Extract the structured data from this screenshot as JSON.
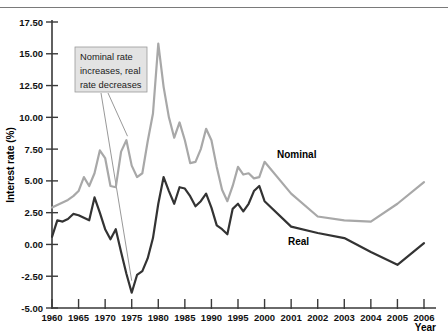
{
  "figure": {
    "top_rule": true,
    "background": "#ffffff"
  },
  "axes": {
    "y_title": "Interest rate (%)",
    "x_title": "Year",
    "y_ticks": [
      "-5.00",
      "-2.50",
      "0.00",
      "2.50",
      "5.00",
      "7.50",
      "10.00",
      "12.50",
      "15.00",
      "17.50"
    ],
    "x_ticks": [
      "1960",
      "1965",
      "1970",
      "1975",
      "1980",
      "1985",
      "1990",
      "1995",
      "2000",
      "2001",
      "2002",
      "2003",
      "2004",
      "2005",
      "2006"
    ]
  },
  "annotation": {
    "line1": "Nominal rate",
    "line2": "increases, real",
    "line3": "rate decreases"
  },
  "labels": {
    "nominal": "Nominal",
    "real": "Real"
  },
  "colors": {
    "nominal": "#a8a8a8",
    "real": "#333333",
    "axis": "#3a3a3a",
    "annotation_box": "#e3e3e3",
    "top_rule": "#7a7a7a"
  },
  "chart_data": {
    "type": "line",
    "title": "",
    "xlabel": "Year",
    "ylabel": "Interest rate (%)",
    "ylim": [
      -5.0,
      17.5
    ],
    "ytick_step": 2.5,
    "grid": false,
    "legend": "inline-series-labels",
    "x_axis_note": "Non-uniform: 1960-2000 at 5-year steps, then yearly 2001-2006, all drawn with equal pixel spacing",
    "x_tick_values": [
      1960,
      1965,
      1970,
      1975,
      1980,
      1985,
      1990,
      1995,
      2000,
      2001,
      2002,
      2003,
      2004,
      2005,
      2006
    ],
    "x": [
      1960,
      1961,
      1962,
      1963,
      1964,
      1965,
      1966,
      1967,
      1968,
      1969,
      1970,
      1971,
      1972,
      1973,
      1974,
      1975,
      1976,
      1977,
      1978,
      1979,
      1980,
      1981,
      1982,
      1983,
      1984,
      1985,
      1986,
      1987,
      1988,
      1989,
      1990,
      1991,
      1992,
      1993,
      1994,
      1995,
      1996,
      1997,
      1998,
      1999,
      2000,
      2001,
      2002,
      2003,
      2004,
      2005,
      2006
    ],
    "series": [
      {
        "name": "Nominal",
        "color": "#a8a8a8",
        "values": [
          2.9,
          3.1,
          3.3,
          3.5,
          3.8,
          4.2,
          5.3,
          4.6,
          5.6,
          7.4,
          6.8,
          4.6,
          4.5,
          7.3,
          8.2,
          6.2,
          5.3,
          5.6,
          8.1,
          10.3,
          15.8,
          12.4,
          10.0,
          8.4,
          9.6,
          8.2,
          6.4,
          6.5,
          7.5,
          9.1,
          8.2,
          6.1,
          4.3,
          3.4,
          4.6,
          6.1,
          5.5,
          5.6,
          5.2,
          5.3,
          6.5,
          4.0,
          2.2,
          1.9,
          1.8,
          3.2,
          4.9
        ]
      },
      {
        "name": "Real",
        "color": "#333333",
        "values": [
          0.6,
          1.9,
          1.8,
          2.0,
          2.4,
          2.3,
          2.1,
          1.9,
          3.7,
          2.5,
          1.2,
          0.4,
          1.2,
          -0.6,
          -2.3,
          -3.8,
          -2.4,
          -2.1,
          -1.1,
          0.5,
          3.2,
          5.3,
          4.2,
          3.2,
          4.5,
          4.4,
          3.8,
          3.0,
          3.4,
          4.0,
          2.9,
          1.5,
          1.2,
          0.8,
          2.8,
          3.2,
          2.6,
          3.2,
          4.2,
          4.6,
          3.4,
          1.4,
          0.9,
          0.5,
          -0.6,
          -1.6,
          0.1
        ]
      }
    ],
    "annotations": [
      {
        "text": "Nominal rate increases, real rate decreases",
        "points_to": [
          "Nominal series circa 1974",
          "Real series circa 1974"
        ]
      }
    ]
  }
}
